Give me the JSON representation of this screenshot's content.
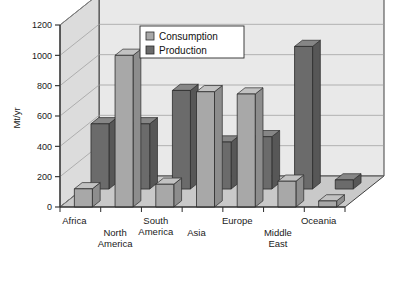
{
  "chart_data": {
    "type": "bar",
    "title": "",
    "subtitle": "",
    "xlabel": "",
    "ylabel": "Mt/yr",
    "ylim": [
      0,
      1200
    ],
    "yticks": [
      0,
      200,
      400,
      600,
      800,
      1000,
      1200
    ],
    "grid": true,
    "projection": "3d",
    "legend_position": "top-center",
    "categories": [
      "Africa",
      "North America",
      "South America",
      "Asia",
      "Europe",
      "Middle East",
      "Oceania"
    ],
    "category_labels_multiline": [
      [
        "Africa"
      ],
      [
        "North",
        "America"
      ],
      [
        "South",
        "America"
      ],
      [
        "Asia"
      ],
      [
        "Europe"
      ],
      [
        "Middle",
        "East"
      ],
      [
        "Oceania"
      ]
    ],
    "series": [
      {
        "name": "Consumption",
        "color": "#a8a8a8",
        "values": [
          120,
          1000,
          150,
          760,
          745,
          170,
          40
        ]
      },
      {
        "name": "Production",
        "color": "#6b6b6b",
        "values": [
          430,
          430,
          650,
          310,
          345,
          940,
          60
        ]
      }
    ]
  },
  "legend": {
    "items": [
      {
        "label": "Consumption",
        "swatch_icon": "square-swatch-light",
        "color": "#a8a8a8"
      },
      {
        "label": "Production",
        "swatch_icon": "square-swatch-dark",
        "color": "#6b6b6b"
      }
    ]
  },
  "axis": {
    "y_title": "Mt/yr",
    "y_tick_labels": [
      "1200",
      "1000",
      "800",
      "600",
      "400",
      "200",
      "0"
    ]
  },
  "colors": {
    "consumption_face": "#a8a8a8",
    "consumption_top": "#c2c2c2",
    "consumption_side": "#8d8d8d",
    "production_face": "#6b6b6b",
    "production_top": "#868686",
    "production_side": "#575757",
    "wall_back": "#e9e9e9",
    "wall_side": "#dcdcdc",
    "floor": "#c9c9c9",
    "grid_line": "#9a9a9a",
    "outline": "#2b2b2b",
    "background": "#ffffff"
  }
}
